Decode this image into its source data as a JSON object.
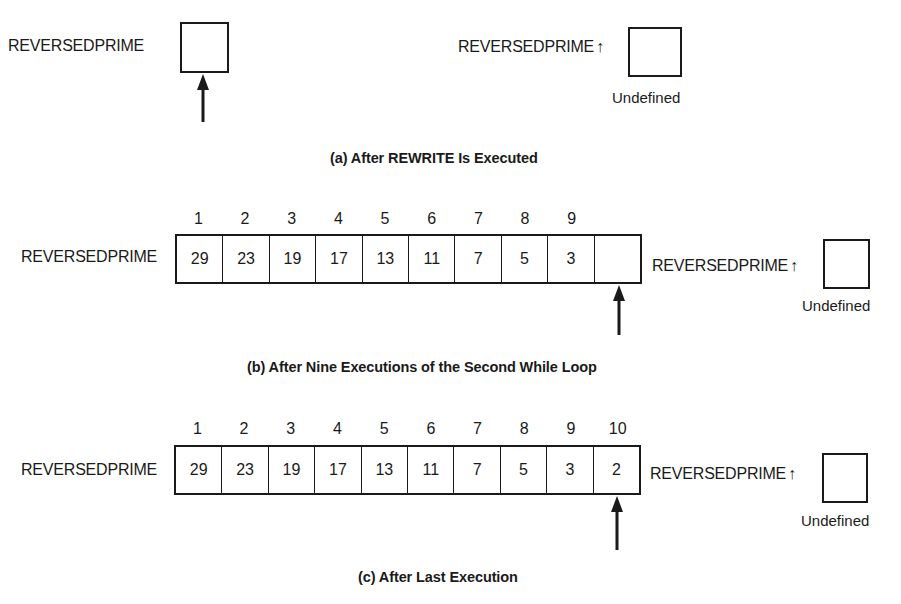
{
  "panels": [
    {
      "id": "a",
      "caption": "(a) After REWRITE Is Executed",
      "file_label": "REVERSEDPRIME",
      "indices": [],
      "cells": [
        ""
      ],
      "pointer_label": "REVERSEDPRIME",
      "pointer_symbol": "↑",
      "buffer_value": "",
      "buffer_note": "Undefined",
      "window_position": 1
    },
    {
      "id": "b",
      "caption": "(b) After Nine Executions of the Second While Loop",
      "file_label": "REVERSEDPRIME",
      "indices": [
        "1",
        "2",
        "3",
        "4",
        "5",
        "6",
        "7",
        "8",
        "9",
        ""
      ],
      "cells": [
        "29",
        "23",
        "19",
        "17",
        "13",
        "11",
        "7",
        "5",
        "3",
        ""
      ],
      "pointer_label": "REVERSEDPRIME",
      "pointer_symbol": "↑",
      "buffer_value": "",
      "buffer_note": "Undefined",
      "window_position": 10
    },
    {
      "id": "c",
      "caption": "(c) After Last Execution",
      "file_label": "REVERSEDPRIME",
      "indices": [
        "1",
        "2",
        "3",
        "4",
        "5",
        "6",
        "7",
        "8",
        "9",
        "10"
      ],
      "cells": [
        "29",
        "23",
        "19",
        "17",
        "13",
        "11",
        "7",
        "5",
        "3",
        "2"
      ],
      "pointer_label": "REVERSEDPRIME",
      "pointer_symbol": "↑",
      "buffer_value": "",
      "buffer_note": "Undefined",
      "window_position": 10
    }
  ],
  "colors": {
    "ink": "#1a1a1a",
    "background": "#ffffff"
  }
}
